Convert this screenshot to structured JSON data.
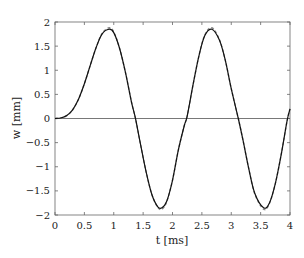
{
  "chart_data": {
    "type": "line",
    "title": "",
    "xlabel": "t [ms]",
    "ylabel": "w [mm]",
    "xlim": [
      0,
      4
    ],
    "ylim": [
      -2,
      2
    ],
    "grid": false,
    "legend": null,
    "x_ticks": [
      0,
      0.5,
      1,
      1.5,
      2,
      2.5,
      3,
      3.5,
      4
    ],
    "x_tick_labels": [
      "0",
      "0.5",
      "1",
      "1.5",
      "2",
      "2.5",
      "3",
      "3.5",
      "4"
    ],
    "y_ticks": [
      -2,
      -1.5,
      -1,
      -0.5,
      0,
      0.5,
      1,
      1.5,
      2
    ],
    "y_tick_labels": [
      "−2",
      "−1.5",
      "−1",
      "−0.5",
      "0",
      "0.5",
      "1",
      "1.5",
      "2"
    ],
    "reference_line": {
      "y": 0,
      "color": "#555555"
    },
    "series": [
      {
        "name": "solution",
        "style": "solid",
        "color": "#111111",
        "x": [
          0,
          0.1,
          0.2,
          0.3,
          0.4,
          0.5,
          0.6,
          0.7,
          0.8,
          0.92,
          1.0,
          1.1,
          1.2,
          1.3,
          1.37,
          1.45,
          1.55,
          1.65,
          1.75,
          1.82,
          1.9,
          2.0,
          2.1,
          2.2,
          2.25,
          2.35,
          2.45,
          2.55,
          2.67,
          2.8,
          2.9,
          3.0,
          3.12,
          3.2,
          3.3,
          3.4,
          3.55,
          3.65,
          3.75,
          3.85,
          3.95,
          4.0
        ],
        "y": [
          0,
          0.01,
          0.06,
          0.18,
          0.4,
          0.72,
          1.1,
          1.47,
          1.75,
          1.85,
          1.78,
          1.45,
          0.95,
          0.35,
          0.0,
          -0.5,
          -1.1,
          -1.58,
          -1.83,
          -1.85,
          -1.72,
          -1.28,
          -0.65,
          -0.15,
          0.05,
          0.7,
          1.3,
          1.72,
          1.85,
          1.62,
          1.2,
          0.62,
          0.0,
          -0.45,
          -1.05,
          -1.55,
          -1.85,
          -1.75,
          -1.35,
          -0.75,
          -0.05,
          0.2
        ]
      },
      {
        "name": "reference",
        "style": "dashed",
        "color": "#888888",
        "note": "nearly coincides with solid curve; slight deviation near extrema",
        "x": [
          0,
          0.1,
          0.2,
          0.3,
          0.4,
          0.5,
          0.6,
          0.7,
          0.8,
          0.92,
          1.0,
          1.1,
          1.2,
          1.3,
          1.37,
          1.45,
          1.55,
          1.65,
          1.75,
          1.82,
          1.9,
          2.0,
          2.1,
          2.2,
          2.25,
          2.35,
          2.45,
          2.55,
          2.67,
          2.8,
          2.9,
          3.0,
          3.12,
          3.2,
          3.3,
          3.4,
          3.55,
          3.65,
          3.75,
          3.85,
          3.95,
          4.0
        ],
        "y": [
          0,
          0.01,
          0.06,
          0.18,
          0.4,
          0.72,
          1.1,
          1.47,
          1.76,
          1.88,
          1.79,
          1.45,
          0.95,
          0.35,
          0.0,
          -0.5,
          -1.1,
          -1.58,
          -1.84,
          -1.88,
          -1.73,
          -1.28,
          -0.65,
          -0.15,
          0.05,
          0.7,
          1.3,
          1.73,
          1.88,
          1.63,
          1.2,
          0.62,
          0.0,
          -0.45,
          -1.05,
          -1.56,
          -1.88,
          -1.76,
          -1.35,
          -0.75,
          -0.05,
          0.2
        ]
      }
    ]
  },
  "labels": {
    "x_axis": "t [ms]",
    "y_axis": "w [mm]"
  }
}
